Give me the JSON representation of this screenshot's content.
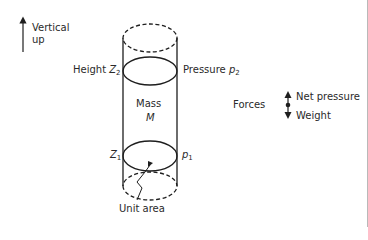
{
  "diagram": {
    "type": "hydrostatic-cylinder",
    "labels": {
      "vertical_up_line1": "Vertical",
      "vertical_up_line2": "up",
      "height_top_prefix": "Height ",
      "height_top_var": "Z",
      "height_top_sub": "2",
      "pressure_top_prefix": "Pressure ",
      "pressure_top_var": "p",
      "pressure_top_sub": "2",
      "mass_word": "Mass",
      "mass_symbol": "M",
      "height_bottom_var": "Z",
      "height_bottom_sub": "1",
      "pressure_bottom_var": "p",
      "pressure_bottom_sub": "1",
      "unit_area": "Unit area",
      "forces": "Forces",
      "net_pressure": "Net pressure",
      "weight": "Weight"
    },
    "colors": {
      "stroke": "#1e1e1e",
      "text": "#2a2a2a",
      "background": "#ffffff"
    }
  }
}
